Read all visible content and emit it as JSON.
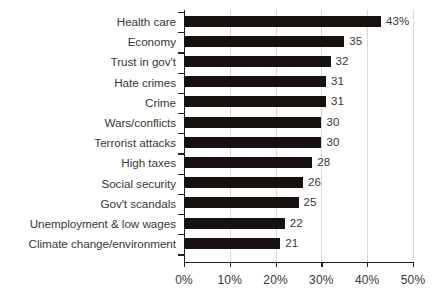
{
  "chart_data": {
    "type": "bar",
    "orientation": "horizontal",
    "title": "",
    "subtitle": "",
    "xlabel": "",
    "ylabel": "",
    "xlim": [
      0,
      50
    ],
    "x_tick_labels": [
      "0%",
      "10%",
      "20%",
      "30%",
      "40%",
      "50%"
    ],
    "x_ticks": [
      0,
      10,
      20,
      30,
      40,
      50
    ],
    "grid": true,
    "grid_axis": "x",
    "legend": false,
    "legend_position": "none",
    "bar_color": "#17120f",
    "text_color": "#3a3734",
    "gridline_color": "#d9d9d9",
    "axis_color": "#231f20",
    "background_color": "#ffffff",
    "categories": [
      "Health care",
      "Economy",
      "Trust in gov't",
      "Hate crimes",
      "Crime",
      "Wars/conflicts",
      "Terrorist attacks",
      "High taxes",
      "Social security",
      "Gov't scandals",
      "Unemployment & low wages",
      "Climate change/environment"
    ],
    "values": [
      43,
      35,
      32,
      31,
      31,
      30,
      30,
      28,
      26,
      25,
      22,
      21
    ],
    "data_labels": [
      "43%",
      "35",
      "32",
      "31",
      "31",
      "30",
      "30",
      "28",
      "26",
      "25",
      "22",
      "21"
    ]
  }
}
